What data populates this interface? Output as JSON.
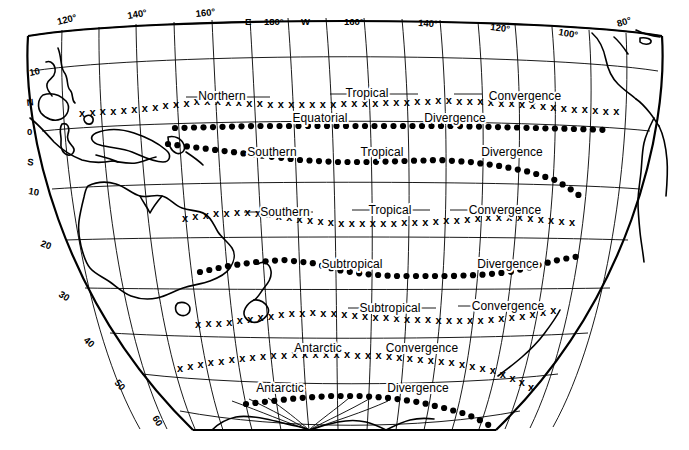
{
  "map": {
    "title": "Pacific Ocean convergence and divergence zones",
    "projection": "conic",
    "background_color": "#ffffff",
    "line_color": "#000000",
    "longitude_labels": [
      {
        "text": "120°",
        "lon": 120,
        "hemisphere": "E"
      },
      {
        "text": "140°",
        "lon": 140,
        "hemisphere": "E"
      },
      {
        "text": "160°",
        "lon": 160,
        "hemisphere": "E"
      },
      {
        "text": "E",
        "lon": 175,
        "hemisphere": "E"
      },
      {
        "text": "180°",
        "lon": 180,
        "hemisphere": ""
      },
      {
        "text": "W",
        "lon": 185,
        "hemisphere": "W"
      },
      {
        "text": "160°",
        "lon": 200,
        "hemisphere": "W"
      },
      {
        "text": "140°",
        "lon": 220,
        "hemisphere": "W"
      },
      {
        "text": "120°",
        "lon": 240,
        "hemisphere": "W"
      },
      {
        "text": "100°",
        "lon": 260,
        "hemisphere": "W"
      },
      {
        "text": "80°",
        "lon": 280,
        "hemisphere": "W"
      }
    ],
    "latitude_labels": [
      {
        "text": "10",
        "lat": 10
      },
      {
        "text": "N",
        "lat": 5
      },
      {
        "text": "0",
        "lat": 0
      },
      {
        "text": "S",
        "lat": -5
      },
      {
        "text": "10",
        "lat": -10
      },
      {
        "text": "20",
        "lat": -20
      },
      {
        "text": "30",
        "lat": -30
      },
      {
        "text": "40",
        "lat": -40
      },
      {
        "text": "50",
        "lat": -50
      },
      {
        "text": "60",
        "lat": -60
      }
    ],
    "zones": [
      {
        "id": "northern-tropical-convergence",
        "marker": "x",
        "words": [
          "Northern",
          "Tropical",
          "Convergence"
        ],
        "approx_latitude": 5
      },
      {
        "id": "equatorial-divergence",
        "marker": "dot",
        "words": [
          "Equatorial",
          "Divergence"
        ],
        "approx_latitude": 0
      },
      {
        "id": "southern-tropical-divergence",
        "marker": "dot",
        "words": [
          "Southern",
          "Tropical",
          "Divergence"
        ],
        "approx_latitude": -5
      },
      {
        "id": "southern-tropical-convergence",
        "marker": "x",
        "words": [
          "Southern",
          "Tropical",
          "Convergence"
        ],
        "approx_latitude": -17
      },
      {
        "id": "subtropical-divergence",
        "marker": "dot",
        "words": [
          "Subtropical",
          "Divergence"
        ],
        "approx_latitude": -28
      },
      {
        "id": "subtropical-convergence",
        "marker": "x",
        "words": [
          "Subtropical",
          "Convergence"
        ],
        "approx_latitude": -36
      },
      {
        "id": "antarctic-convergence",
        "marker": "x",
        "words": [
          "Antarctic",
          "Convergence"
        ],
        "approx_latitude": -50
      },
      {
        "id": "antarctic-divergence",
        "marker": "dot",
        "words": [
          "Antarctic",
          "Divergence"
        ],
        "approx_latitude": -58
      }
    ],
    "zone_text": {
      "northern": "Northern",
      "tropical": "Tropical",
      "convergence": "Convergence",
      "equatorial": "Equatorial",
      "divergence": "Divergence",
      "southern": "Southern",
      "subtropical": "Subtropical",
      "antarctic": "Antarctic"
    },
    "labels": {
      "l1_a": "Northern",
      "l1_b": "Tropical",
      "l1_c": "Convergence",
      "l2_a": "Equatorial",
      "l2_b": "Divergence",
      "l3_a": "Southern",
      "l3_b": "Tropical",
      "l3_c": "Divergence",
      "l4_a": "Southern",
      "l4_b": "Tropical",
      "l4_c": "Convergence",
      "l5_a": "Subtropical",
      "l5_b": "Divergence",
      "l6_a": "Subtropical",
      "l6_b": "Convergence",
      "l7_a": "Antarctic",
      "l7_b": "Convergence",
      "l8_a": "Antarctic",
      "l8_b": "Divergence"
    },
    "lon_ticks": {
      "t120e": "120°",
      "t140e": "140°",
      "t160e": "160°",
      "e": "E",
      "t180": "180°",
      "w": "W",
      "t160w": "160°",
      "t140w": "140°",
      "t120w": "120°",
      "t100w": "100°",
      "t80w": "80°"
    },
    "lat_ticks": {
      "n10": "10",
      "n": "N",
      "eq": "0",
      "s": "S",
      "s10": "10",
      "s20": "20",
      "s30": "30",
      "s40": "40",
      "s50": "50",
      "s60": "60"
    }
  }
}
